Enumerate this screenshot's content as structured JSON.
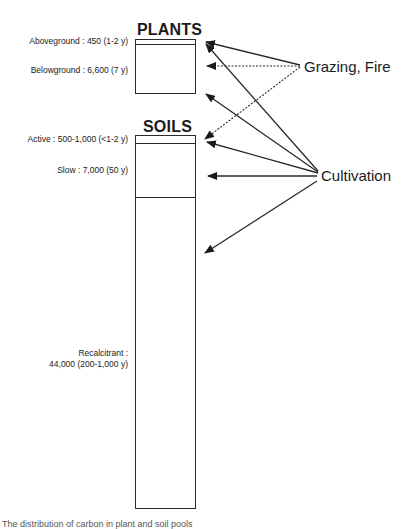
{
  "diagram": {
    "plants": {
      "title": "PLANTS",
      "pools": [
        {
          "label": "Aboveground : 450 (1-2 y)"
        },
        {
          "label": "Belowground : 6,600 (7 y)"
        }
      ]
    },
    "soils": {
      "title": "SOILS",
      "pools": [
        {
          "label": "Active : 500-1,000 (<1-2 y)"
        },
        {
          "label": "Slow : 7,000 (50 y)"
        },
        {
          "label_line1": "Recalcitrant :",
          "label_line2": "44,000 (200-1,000 y)"
        }
      ]
    },
    "drivers": [
      {
        "label": "Grazing, Fire",
        "targets": [
          "Aboveground",
          "Belowground",
          "Active"
        ]
      },
      {
        "label": "Cultivation",
        "targets": [
          "Aboveground",
          "Belowground",
          "Active",
          "Slow",
          "Recalcitrant"
        ]
      }
    ],
    "caption": "The distribution of carbon in plant and soil pools"
  },
  "colors": {
    "line": "#2a2a2a",
    "text": "#1a1a1a",
    "background": "#ffffff"
  }
}
